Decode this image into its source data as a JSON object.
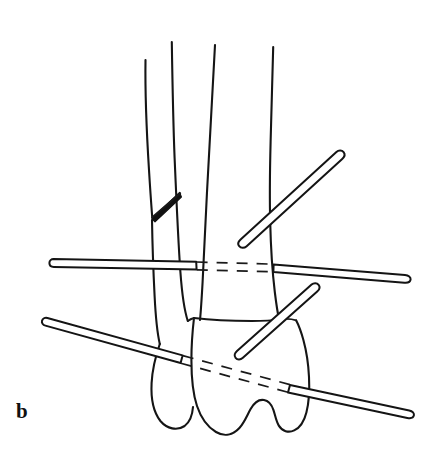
{
  "figure": {
    "panel_label": "b",
    "caption_letter": "b",
    "background_color": "#ffffff",
    "ink_color": "#141414",
    "width": 432,
    "height": 472,
    "type": "line-drawing",
    "anatomy": [
      {
        "name": "fibula",
        "side": "lateral",
        "description": "slender lateral bone with oblique fracture and lateral malleolus"
      },
      {
        "name": "tibia",
        "side": "medial",
        "description": "wide central shaft with distal articular surface"
      },
      {
        "name": "talus",
        "description": "rounded bone of the hindfoot beneath the tibial plafond"
      }
    ],
    "features": [
      {
        "name": "fibular-oblique-fracture",
        "shading": "solid black wedge"
      },
      {
        "name": "ankle-joint-line"
      }
    ],
    "fixation_pins": [
      {
        "id": "pin-upper-right-oblique",
        "label": "upper lateral half-pin",
        "orientation": "oblique up-right",
        "hidden_segment": false
      },
      {
        "id": "pin-transverse-upper",
        "label": "transverse tibial transfixion pin",
        "orientation": "horizontal",
        "hidden_segment": true
      },
      {
        "id": "pin-mid-right-oblique",
        "label": "lateral talar half-pin",
        "orientation": "oblique up-right",
        "hidden_segment": false
      },
      {
        "id": "pin-transverse-lower",
        "label": "transverse talar transfixion pin",
        "orientation": "oblique down-right",
        "hidden_segment": true
      }
    ]
  }
}
